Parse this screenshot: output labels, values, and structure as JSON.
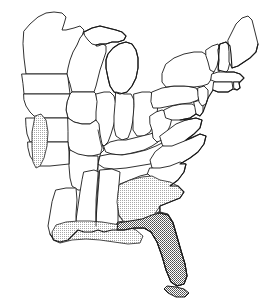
{
  "figure": {
    "kind": "distribution-range-map",
    "title": "",
    "caption": "",
    "region_name": "Eastern United States",
    "projection_note": "",
    "background_color": "#ffffff",
    "outline_color": "#1a1a1a",
    "width_px": 269,
    "height_px": 302
  },
  "legend": {
    "present": false,
    "entries": [
      {
        "key": "core-range",
        "label": "",
        "fill_color": "#8f8f8f",
        "pattern": "dense-stipple"
      },
      {
        "key": "peripheral-range",
        "label": "",
        "fill_color": "#d2d2d2",
        "pattern": "light-stipple"
      }
    ]
  },
  "shaded_ranges": [
    {
      "id": "florida-peninsula",
      "name": "Florida peninsula and Keys",
      "shade": "dense-stipple",
      "fill_color": "#8f8f8f",
      "states": [
        "Florida"
      ]
    },
    {
      "id": "southeast-coastal-plain",
      "name": "Georgia and South Carolina coastal plain",
      "shade": "light-stipple",
      "fill_color": "#d2d2d2",
      "states": [
        "Georgia",
        "South Carolina"
      ]
    },
    {
      "id": "gulf-coast-strip",
      "name": "Gulf coastal strip",
      "shade": "light-stipple",
      "fill_color": "#d2d2d2",
      "states": [
        "Alabama",
        "Mississippi",
        "Louisiana"
      ]
    },
    {
      "id": "missouri-river-corridor",
      "name": "Missouri River corridor",
      "shade": "light-stipple",
      "fill_color": "#d2d2d2",
      "states": [
        "Nebraska",
        "Kansas",
        "Iowa",
        "Missouri"
      ]
    }
  ],
  "states": [
    {
      "code": "ME",
      "name": "Maine",
      "shaded": false
    },
    {
      "code": "NH",
      "name": "New Hampshire",
      "shaded": false
    },
    {
      "code": "VT",
      "name": "Vermont",
      "shaded": false
    },
    {
      "code": "MA",
      "name": "Massachusetts",
      "shaded": false
    },
    {
      "code": "RI",
      "name": "Rhode Island",
      "shaded": false
    },
    {
      "code": "CT",
      "name": "Connecticut",
      "shaded": false
    },
    {
      "code": "NY",
      "name": "New York",
      "shaded": false
    },
    {
      "code": "NJ",
      "name": "New Jersey",
      "shaded": false
    },
    {
      "code": "PA",
      "name": "Pennsylvania",
      "shaded": false
    },
    {
      "code": "DE",
      "name": "Delaware",
      "shaded": false
    },
    {
      "code": "MD",
      "name": "Maryland",
      "shaded": false
    },
    {
      "code": "VA",
      "name": "Virginia",
      "shaded": false
    },
    {
      "code": "WV",
      "name": "West Virginia",
      "shaded": false
    },
    {
      "code": "NC",
      "name": "North Carolina",
      "shaded": false
    },
    {
      "code": "SC",
      "name": "South Carolina",
      "shaded": true
    },
    {
      "code": "GA",
      "name": "Georgia",
      "shaded": true
    },
    {
      "code": "FL",
      "name": "Florida",
      "shaded": true
    },
    {
      "code": "AL",
      "name": "Alabama",
      "shaded": true
    },
    {
      "code": "MS",
      "name": "Mississippi",
      "shaded": true
    },
    {
      "code": "TN",
      "name": "Tennessee",
      "shaded": false
    },
    {
      "code": "KY",
      "name": "Kentucky",
      "shaded": false
    },
    {
      "code": "OH",
      "name": "Ohio",
      "shaded": false
    },
    {
      "code": "MI",
      "name": "Michigan",
      "shaded": false
    },
    {
      "code": "IN",
      "name": "Indiana",
      "shaded": false
    },
    {
      "code": "IL",
      "name": "Illinois",
      "shaded": false
    },
    {
      "code": "WI",
      "name": "Wisconsin",
      "shaded": false
    },
    {
      "code": "MN",
      "name": "Minnesota",
      "shaded": false
    },
    {
      "code": "IA",
      "name": "Iowa",
      "shaded": true
    },
    {
      "code": "MO",
      "name": "Missouri",
      "shaded": true
    },
    {
      "code": "AR",
      "name": "Arkansas",
      "shaded": false
    },
    {
      "code": "LA",
      "name": "Louisiana",
      "shaded": true
    },
    {
      "code": "SD",
      "name": "South Dakota",
      "shaded": false
    },
    {
      "code": "NE",
      "name": "Nebraska",
      "shaded": true
    },
    {
      "code": "KS",
      "name": "Kansas",
      "shaded": true
    },
    {
      "code": "OK",
      "name": "Oklahoma",
      "shaded": false
    }
  ]
}
